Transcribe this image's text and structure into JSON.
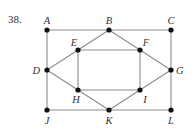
{
  "problem_number": "38.",
  "colors": {
    "edge": "#8c8c8c",
    "node": "#111111",
    "label": "#333333"
  },
  "nodes": [
    {
      "id": "A",
      "x": 47,
      "y": 30,
      "lx": 47,
      "ly": 24,
      "anchor": "middle"
    },
    {
      "id": "B",
      "x": 109,
      "y": 30,
      "lx": 109,
      "ly": 24,
      "anchor": "middle"
    },
    {
      "id": "C",
      "x": 171,
      "y": 30,
      "lx": 171,
      "ly": 24,
      "anchor": "middle"
    },
    {
      "id": "E",
      "x": 78,
      "y": 50,
      "lx": 74,
      "ly": 46,
      "anchor": "middle"
    },
    {
      "id": "F",
      "x": 140,
      "y": 50,
      "lx": 146,
      "ly": 46,
      "anchor": "middle"
    },
    {
      "id": "D",
      "x": 47,
      "y": 70,
      "lx": 40,
      "ly": 74,
      "anchor": "end"
    },
    {
      "id": "G",
      "x": 171,
      "y": 70,
      "lx": 176,
      "ly": 74,
      "anchor": "start"
    },
    {
      "id": "H",
      "x": 78,
      "y": 90,
      "lx": 76,
      "ly": 103,
      "anchor": "middle"
    },
    {
      "id": "I",
      "x": 140,
      "y": 90,
      "lx": 145,
      "ly": 103,
      "anchor": "middle"
    },
    {
      "id": "J",
      "x": 47,
      "y": 110,
      "lx": 47,
      "ly": 124,
      "anchor": "middle"
    },
    {
      "id": "K",
      "x": 109,
      "y": 110,
      "lx": 109,
      "ly": 124,
      "anchor": "middle"
    },
    {
      "id": "L",
      "x": 171,
      "y": 110,
      "lx": 171,
      "ly": 124,
      "anchor": "middle"
    }
  ],
  "edges": [
    [
      "A",
      "B"
    ],
    [
      "B",
      "C"
    ],
    [
      "A",
      "D"
    ],
    [
      "D",
      "J"
    ],
    [
      "J",
      "K"
    ],
    [
      "K",
      "L"
    ],
    [
      "C",
      "G"
    ],
    [
      "G",
      "L"
    ],
    [
      "B",
      "E"
    ],
    [
      "B",
      "F"
    ],
    [
      "E",
      "F"
    ],
    [
      "E",
      "H"
    ],
    [
      "F",
      "I"
    ],
    [
      "H",
      "I"
    ],
    [
      "D",
      "E"
    ],
    [
      "D",
      "H"
    ],
    [
      "G",
      "F"
    ],
    [
      "G",
      "I"
    ],
    [
      "H",
      "K"
    ],
    [
      "I",
      "K"
    ]
  ]
}
